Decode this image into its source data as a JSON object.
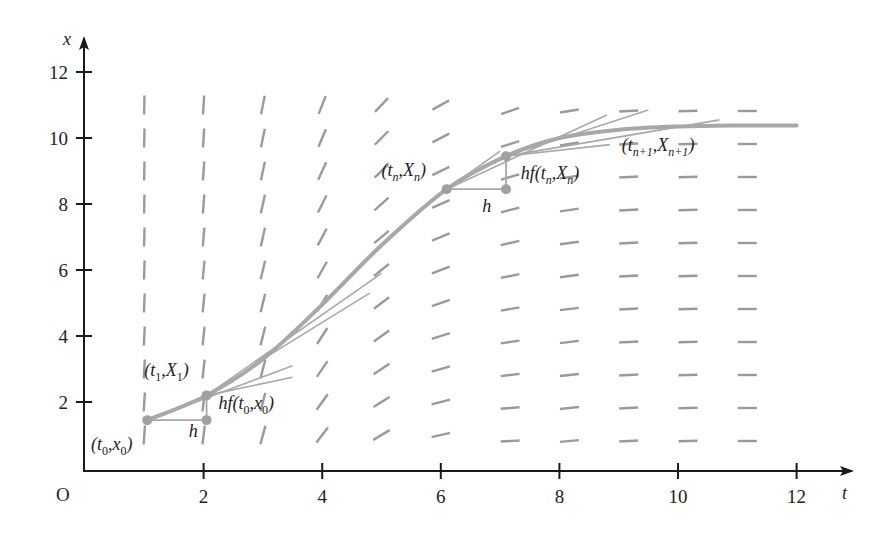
{
  "chart_data": {
    "type": "line",
    "title": "",
    "xlabel": "t",
    "ylabel": "x",
    "origin_label": "O",
    "xlim": [
      0,
      12.4
    ],
    "ylim": [
      0,
      12.8
    ],
    "x_ticks": [
      2,
      4,
      6,
      8,
      10,
      12
    ],
    "y_ticks": [
      2,
      4,
      6,
      8,
      10,
      12
    ],
    "grid": false,
    "slope_field": {
      "t_values": [
        1,
        2,
        3,
        4,
        5,
        6,
        7,
        8,
        9,
        10,
        11
      ],
      "x_values": [
        1,
        2,
        3,
        4,
        5,
        6,
        7,
        8,
        9,
        10,
        11
      ],
      "description": "direction field: nearly vertical for small t, flattening to horizontal for large t"
    },
    "series": [
      {
        "name": "exact solution",
        "points": [
          [
            1.05,
            1.45
          ],
          [
            2.05,
            2.2
          ],
          [
            3.0,
            3.3
          ],
          [
            4.0,
            4.95
          ],
          [
            5.0,
            6.75
          ],
          [
            6.1,
            8.45
          ],
          [
            7.1,
            9.45
          ],
          [
            8.0,
            10.0
          ],
          [
            9.0,
            10.25
          ],
          [
            10.0,
            10.35
          ],
          [
            11.0,
            10.38
          ],
          [
            12.0,
            10.38
          ]
        ]
      }
    ],
    "tangent_lines": [
      {
        "from": [
          1.05,
          1.45
        ],
        "to": [
          3.5,
          3.1
        ]
      },
      {
        "from": [
          2.05,
          2.2
        ],
        "to": [
          3.5,
          2.75
        ]
      },
      {
        "from": [
          2.05,
          2.2
        ],
        "to": [
          5.0,
          5.9
        ]
      },
      {
        "from": [
          3.0,
          3.3
        ],
        "to": [
          4.8,
          5.3
        ]
      },
      {
        "from": [
          6.1,
          8.45
        ],
        "to": [
          7.0,
          9.6
        ]
      },
      {
        "from": [
          6.1,
          8.45
        ],
        "to": [
          8.8,
          10.7
        ]
      },
      {
        "from": [
          7.1,
          9.45
        ],
        "to": [
          9.5,
          10.85
        ]
      },
      {
        "from": [
          7.1,
          9.45
        ],
        "to": [
          10.7,
          10.55
        ]
      },
      {
        "from": [
          7.1,
          9.45
        ],
        "to": [
          8.85,
          9.8
        ]
      }
    ],
    "euler_steps": [
      {
        "start": [
          1.05,
          1.45
        ],
        "corner": [
          2.05,
          1.45
        ],
        "end": [
          2.05,
          2.2
        ]
      },
      {
        "start": [
          6.1,
          8.45
        ],
        "corner": [
          7.1,
          8.45
        ],
        "end": [
          7.1,
          9.45
        ]
      }
    ],
    "annotations": [
      {
        "id": "t0x0",
        "base": "(t",
        "sub1": "0",
        "mid": ",x",
        "sub2": "0",
        "close": ")",
        "at": [
          0.1,
          0.55
        ]
      },
      {
        "id": "h0",
        "text": "h",
        "at": [
          1.75,
          0.95
        ]
      },
      {
        "id": "hf0",
        "base": "hf(t",
        "sub1": "0",
        "mid": ",x",
        "sub2": "0",
        "close": ")",
        "at": [
          2.25,
          1.8
        ]
      },
      {
        "id": "t1X1",
        "base": "(t",
        "sub1": "1",
        "mid": ",X",
        "sub2": "1",
        "close": ")",
        "at": [
          1.0,
          2.8
        ]
      },
      {
        "id": "tnXn",
        "base": "(t",
        "sub1": "n",
        "mid": ",X",
        "sub2": "n",
        "close": ")",
        "at": [
          5.0,
          8.85
        ]
      },
      {
        "id": "hn",
        "text": "h",
        "at": [
          6.7,
          7.75
        ]
      },
      {
        "id": "hfn",
        "base": "hf(t",
        "sub1": "n",
        "mid": ",X",
        "sub2": "n",
        "close": ")",
        "at": [
          7.35,
          8.75
        ]
      },
      {
        "id": "tn1Xn1",
        "base": "(t",
        "sub1": "n+1",
        "mid": ",X",
        "sub2": "n+1",
        "close": ")",
        "at": [
          9.05,
          9.6
        ]
      }
    ]
  },
  "colors": {
    "axis": "#1a1a1a",
    "field": "#9a9a9a",
    "curve": "#a8a8a8",
    "tangent": "#a8a8a8",
    "point": "#a0a0a0",
    "text": "#222222"
  }
}
